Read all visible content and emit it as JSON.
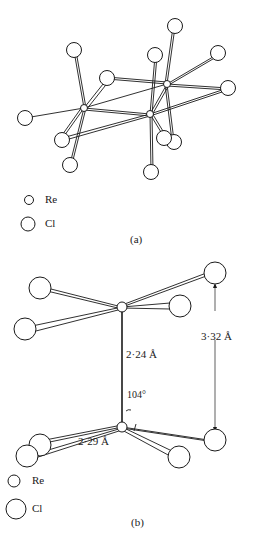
{
  "figure_a": {
    "caption": "(a)",
    "legend": [
      {
        "symbol": "small-circle",
        "label": "Re"
      },
      {
        "symbol": "large-circle",
        "label": "Cl"
      }
    ]
  },
  "figure_b": {
    "caption": "(b)",
    "annotations": {
      "re_re_distance": "2·24 Å",
      "cl_cl_distance": "3·32 Å",
      "re_cl_distance": "2·29 Å",
      "angle": "104°"
    },
    "legend": [
      {
        "symbol": "small-circle",
        "label": "Re"
      },
      {
        "symbol": "large-circle",
        "label": "Cl"
      }
    ]
  }
}
